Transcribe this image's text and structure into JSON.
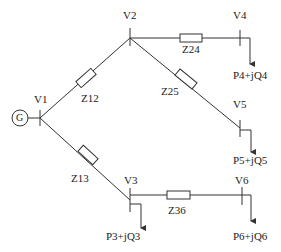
{
  "diagram": {
    "type": "radial power distribution network",
    "generator": {
      "label": "G"
    },
    "buses": [
      {
        "id": "V1",
        "label": "V1"
      },
      {
        "id": "V2",
        "label": "V2"
      },
      {
        "id": "V3",
        "label": "V3"
      },
      {
        "id": "V4",
        "label": "V4"
      },
      {
        "id": "V5",
        "label": "V5"
      },
      {
        "id": "V6",
        "label": "V6"
      }
    ],
    "branches": [
      {
        "id": "Z12",
        "label": "Z12",
        "from": "V1",
        "to": "V2"
      },
      {
        "id": "Z13",
        "label": "Z13",
        "from": "V1",
        "to": "V3"
      },
      {
        "id": "Z24",
        "label": "Z24",
        "from": "V2",
        "to": "V4"
      },
      {
        "id": "Z25",
        "label": "Z25",
        "from": "V2",
        "to": "V5"
      },
      {
        "id": "Z36",
        "label": "Z36",
        "from": "V3",
        "to": "V6"
      }
    ],
    "loads": [
      {
        "bus": "V3",
        "label": "P3+jQ3"
      },
      {
        "bus": "V4",
        "label": "P4+jQ4"
      },
      {
        "bus": "V5",
        "label": "P5+jQ5"
      },
      {
        "bus": "V6",
        "label": "P6+jQ6"
      }
    ],
    "colors": {
      "line": "#333333",
      "background": "#ffffff"
    }
  }
}
